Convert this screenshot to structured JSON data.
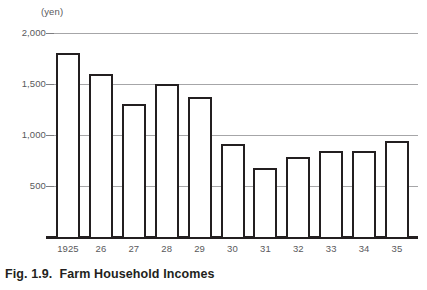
{
  "caption": "Fig. 1.9.  Farm Household Incomes",
  "chart_data": {
    "type": "bar",
    "title": "Fig. 1.9.  Farm Household Incomes",
    "unit_label": "(yen)",
    "xlabel": "",
    "ylabel": "",
    "ylim": [
      0,
      2000
    ],
    "grid": true,
    "legend": "none",
    "ytick_labels": [
      "2,000",
      "1,500",
      "1,000",
      "500"
    ],
    "ytick_values": [
      2000,
      1500,
      1000,
      500
    ],
    "categories": [
      "1925",
      "26",
      "27",
      "28",
      "29",
      "30",
      "31",
      "32",
      "33",
      "34",
      "35"
    ],
    "values": [
      1800,
      1600,
      1300,
      1500,
      1370,
      910,
      680,
      780,
      840,
      840,
      940
    ],
    "series": [
      {
        "name": "Farm household income",
        "values": [
          1800,
          1600,
          1300,
          1500,
          1370,
          910,
          680,
          780,
          840,
          840,
          940
        ]
      }
    ]
  },
  "colors": {
    "bar_outline": "#231f20",
    "bar_fill": "#ffffff",
    "gridline": "#a6a6a8",
    "axis": "#231f20",
    "tick_text": "#59595b",
    "caption_text": "#231f20",
    "background": "#ffffff"
  }
}
